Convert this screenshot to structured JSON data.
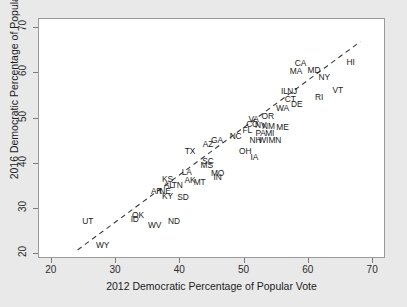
{
  "chart_data": {
    "type": "scatter",
    "title": "",
    "xlabel": "2012 Democratic Percentage of Popular Vote",
    "ylabel": "2016 Democratic Percentage of Popular Vote",
    "xlim": [
      18,
      72
    ],
    "ylim": [
      19,
      72
    ],
    "xticks": [
      20,
      30,
      40,
      50,
      60,
      70
    ],
    "yticks": [
      20,
      30,
      40,
      50,
      60,
      70
    ],
    "grid": false,
    "legend": null,
    "point_marker": "text-label",
    "annotations": [
      {
        "type": "reference-line",
        "style": "dashed",
        "description": "y = x diagonal identity line",
        "from": [
          24,
          21
        ],
        "to": [
          68,
          67
        ]
      }
    ],
    "points": [
      {
        "label": "HI",
        "x": 66.5,
        "y": 62.5
      },
      {
        "label": "CA",
        "x": 58.7,
        "y": 62.3
      },
      {
        "label": "MD",
        "x": 60.8,
        "y": 60.8
      },
      {
        "label": "MA",
        "x": 58.0,
        "y": 60.5
      },
      {
        "label": "NY",
        "x": 62.4,
        "y": 59.2
      },
      {
        "label": "VT",
        "x": 64.5,
        "y": 56.4
      },
      {
        "label": "RI",
        "x": 61.6,
        "y": 54.8
      },
      {
        "label": "IL",
        "x": 56.2,
        "y": 56.1
      },
      {
        "label": "NJ",
        "x": 57.4,
        "y": 56.0
      },
      {
        "label": "CT",
        "x": 57.1,
        "y": 54.4
      },
      {
        "label": "DE",
        "x": 58.1,
        "y": 53.2
      },
      {
        "label": "WA",
        "x": 55.9,
        "y": 52.4
      },
      {
        "label": "OR",
        "x": 53.6,
        "y": 50.5
      },
      {
        "label": "VA",
        "x": 51.4,
        "y": 50.0
      },
      {
        "label": "ME",
        "x": 55.9,
        "y": 48.1
      },
      {
        "label": "NM",
        "x": 53.7,
        "y": 48.3
      },
      {
        "label": "NV",
        "x": 52.5,
        "y": 48.6
      },
      {
        "label": "CO",
        "x": 51.2,
        "y": 48.9
      },
      {
        "label": "MI",
        "x": 53.9,
        "y": 46.9
      },
      {
        "label": "PA",
        "x": 52.5,
        "y": 46.9
      },
      {
        "label": "FL",
        "x": 50.4,
        "y": 47.4
      },
      {
        "label": "NC",
        "x": 48.6,
        "y": 46.2
      },
      {
        "label": "MN",
        "x": 54.7,
        "y": 45.2
      },
      {
        "label": "WI",
        "x": 52.9,
        "y": 45.2
      },
      {
        "label": "NH",
        "x": 51.7,
        "y": 45.3
      },
      {
        "label": "GA",
        "x": 45.7,
        "y": 45.3
      },
      {
        "label": "AZ",
        "x": 44.3,
        "y": 44.3
      },
      {
        "label": "OH",
        "x": 50.1,
        "y": 42.8
      },
      {
        "label": "IA",
        "x": 51.5,
        "y": 41.5
      },
      {
        "label": "TX",
        "x": 41.5,
        "y": 42.8
      },
      {
        "label": "SC",
        "x": 44.3,
        "y": 40.6
      },
      {
        "label": "MS",
        "x": 44.1,
        "y": 39.7
      },
      {
        "label": "MO",
        "x": 45.8,
        "y": 38.0
      },
      {
        "label": "IN",
        "x": 45.8,
        "y": 37.0
      },
      {
        "label": "LA",
        "x": 41.0,
        "y": 38.3
      },
      {
        "label": "AK",
        "x": 41.5,
        "y": 36.4
      },
      {
        "label": "KS",
        "x": 38.0,
        "y": 36.7
      },
      {
        "label": "MT",
        "x": 43.0,
        "y": 36.0
      },
      {
        "label": "TN",
        "x": 39.5,
        "y": 35.3
      },
      {
        "label": "AL",
        "x": 38.2,
        "y": 35.3
      },
      {
        "label": "NE",
        "x": 37.6,
        "y": 34.1
      },
      {
        "label": "AR",
        "x": 36.3,
        "y": 34.0
      },
      {
        "label": "KY",
        "x": 38.0,
        "y": 32.9
      },
      {
        "label": "SD",
        "x": 40.4,
        "y": 32.6
      },
      {
        "label": "OK",
        "x": 33.4,
        "y": 28.8
      },
      {
        "label": "ID",
        "x": 32.9,
        "y": 27.9
      },
      {
        "label": "ND",
        "x": 39.0,
        "y": 27.3
      },
      {
        "label": "WV",
        "x": 36.0,
        "y": 26.5
      },
      {
        "label": "UT",
        "x": 25.6,
        "y": 27.5
      },
      {
        "label": "WY",
        "x": 27.9,
        "y": 22.1
      }
    ]
  },
  "figure": {
    "xtick_labels": [
      "20",
      "30",
      "40",
      "50",
      "60",
      "70"
    ],
    "ytick_labels": [
      "20",
      "30",
      "40",
      "50",
      "60",
      "70"
    ]
  }
}
